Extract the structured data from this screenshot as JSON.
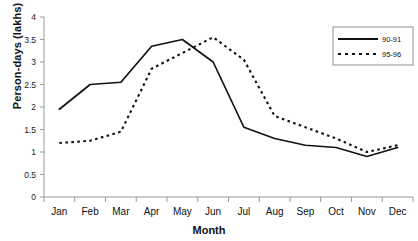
{
  "chart_data": {
    "type": "line",
    "title": "",
    "xlabel": "Month",
    "ylabel": "Person-days (lakhs)",
    "categories": [
      "Jan",
      "Feb",
      "Mar",
      "Apr",
      "May",
      "Jun",
      "Jul",
      "Aug",
      "Sep",
      "Oct",
      "Nov",
      "Dec"
    ],
    "ylim": [
      0,
      4
    ],
    "ytick_labels": [
      "0",
      "0.5",
      "1",
      "1.5",
      "2",
      "2.5",
      "3",
      "3.5",
      "4"
    ],
    "ytick_values": [
      0,
      0.5,
      1,
      1.5,
      2,
      2.5,
      3,
      3.5,
      4
    ],
    "grid": false,
    "legend_position": "top-right",
    "series": [
      {
        "name": "90-91",
        "style": "solid",
        "color": "#111111",
        "values": [
          1.95,
          2.5,
          2.55,
          3.35,
          3.5,
          3.0,
          1.55,
          1.3,
          1.15,
          1.1,
          0.9,
          1.1
        ]
      },
      {
        "name": "95-96",
        "style": "dashed",
        "color": "#111111",
        "values": [
          1.2,
          1.25,
          1.45,
          2.85,
          3.2,
          3.55,
          3.05,
          1.8,
          1.55,
          1.3,
          1.0,
          1.15
        ]
      }
    ]
  },
  "legend": {
    "entries": [
      {
        "label": "90-91"
      },
      {
        "label": "95-96"
      }
    ]
  },
  "axes": {
    "x_title": "Month",
    "y_title": "Person-days (lakhs)"
  }
}
